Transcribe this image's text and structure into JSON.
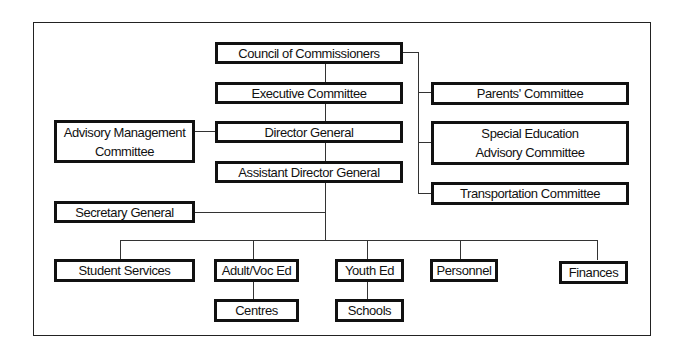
{
  "diagram": {
    "type": "org-chart",
    "nodes": {
      "council": "Council of Commissioners",
      "executive": "Executive Committee",
      "director_general": "Director General",
      "assistant_director_general": "Assistant Director General",
      "advisory_management": [
        "Advisory Management",
        "Committee"
      ],
      "secretary_general": "Secretary General",
      "parents": "Parents' Committee",
      "special_education": [
        "Special Education",
        "Advisory Committee"
      ],
      "transportation": "Transportation Committee",
      "student_services": "Student Services",
      "adult_voc_ed": "Adult/Voc Ed",
      "youth_ed": "Youth Ed",
      "personnel": "Personnel",
      "finances": "Finances",
      "centres": "Centres",
      "schools": "Schools"
    },
    "edges": [
      [
        "Council of Commissioners",
        "Executive Committee"
      ],
      [
        "Executive Committee",
        "Director General"
      ],
      [
        "Director General",
        "Assistant Director General"
      ],
      [
        "Advisory Management Committee",
        "Director General"
      ],
      [
        "Council of Commissioners",
        "Parents' Committee"
      ],
      [
        "Council of Commissioners",
        "Special Education Advisory Committee"
      ],
      [
        "Council of Commissioners",
        "Transportation Committee"
      ],
      [
        "Assistant Director General",
        "Secretary General"
      ],
      [
        "Assistant Director General",
        "Student Services"
      ],
      [
        "Assistant Director General",
        "Adult/Voc Ed"
      ],
      [
        "Assistant Director General",
        "Youth Ed"
      ],
      [
        "Assistant Director General",
        "Personnel"
      ],
      [
        "Assistant Director General",
        "Finances"
      ],
      [
        "Adult/Voc Ed",
        "Centres"
      ],
      [
        "Youth Ed",
        "Schools"
      ]
    ]
  }
}
